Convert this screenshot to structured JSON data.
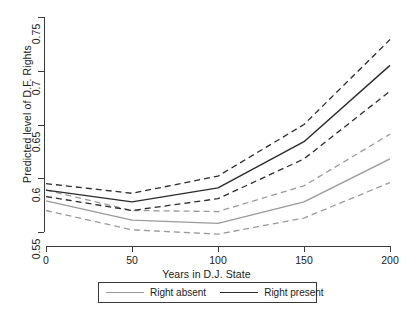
{
  "chart_data": {
    "type": "line",
    "title": "",
    "xlabel": "Years in D.J. State",
    "ylabel": "Predicted level of D.F. Rights",
    "x": [
      0,
      50,
      100,
      150,
      200
    ],
    "xlim": [
      0,
      200
    ],
    "ylim": [
      0.55,
      0.75
    ],
    "xticks": [
      "0",
      "50",
      "100",
      "150",
      "200"
    ],
    "yticks": [
      "0.55",
      "0.6",
      "0.65",
      "0.7",
      "0.75"
    ],
    "grid": false,
    "legend_position": "below-axis",
    "series": [
      {
        "name": "Right absent",
        "style": "solid",
        "color": "#9a9a9a",
        "values": [
          0.579,
          0.561,
          0.558,
          0.578,
          0.618
        ]
      },
      {
        "name": "Right absent upper CI",
        "style": "dashed",
        "color": "#9a9a9a",
        "values": [
          0.589,
          0.57,
          0.569,
          0.593,
          0.641
        ]
      },
      {
        "name": "Right absent lower CI",
        "style": "dashed",
        "color": "#9a9a9a",
        "values": [
          0.57,
          0.552,
          0.548,
          0.563,
          0.596
        ]
      },
      {
        "name": "Right present",
        "style": "solid",
        "color": "#2b2b2b",
        "values": [
          0.589,
          0.578,
          0.591,
          0.634,
          0.705
        ]
      },
      {
        "name": "Right present upper CI",
        "style": "dashed",
        "color": "#2b2b2b",
        "values": [
          0.595,
          0.586,
          0.602,
          0.65,
          0.729
        ]
      },
      {
        "name": "Right present lower CI",
        "style": "dashed",
        "color": "#2b2b2b",
        "values": [
          0.583,
          0.57,
          0.581,
          0.618,
          0.681
        ]
      }
    ],
    "legend": [
      {
        "label": "Right absent",
        "color": "#9a9a9a"
      },
      {
        "label": "Right present",
        "color": "#2b2b2b"
      }
    ]
  },
  "axes": {
    "y_title": "Predicted level of D.F. Rights",
    "x_title": "Years in D.J. State",
    "y_ticks": [
      "0.55",
      "0.6",
      "0.65",
      "0.7",
      "0.75"
    ],
    "x_ticks": [
      "0",
      "50",
      "100",
      "150",
      "200"
    ]
  },
  "legend": {
    "absent_label": "Right absent",
    "present_label": "Right present"
  }
}
